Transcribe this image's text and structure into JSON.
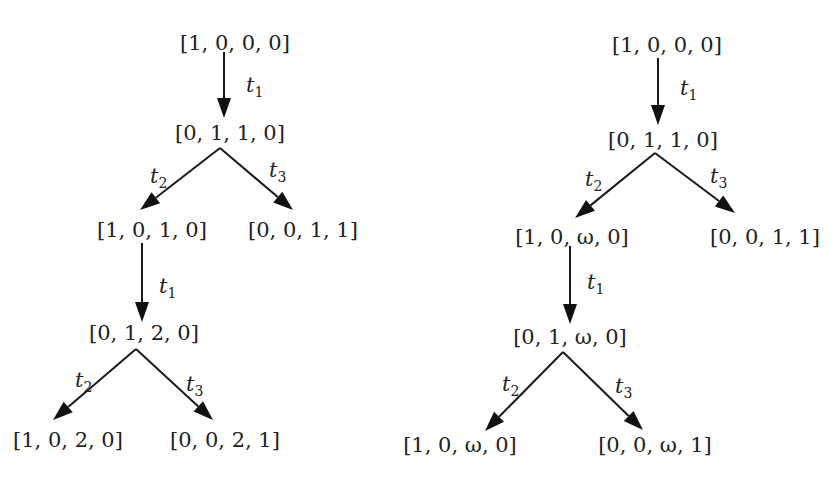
{
  "diagram": {
    "type": "coverability-trees",
    "colors": {
      "ink": "#1a1a1a",
      "background": "#ffffff"
    },
    "trees": [
      {
        "id": "reachability-tree",
        "nodes": [
          {
            "id": "a0",
            "label": "[1, 0, 0, 0]",
            "x": 235,
            "y": 43
          },
          {
            "id": "a1",
            "label": "[0, 1, 1, 0]",
            "x": 230,
            "y": 133
          },
          {
            "id": "a2",
            "label": "[1, 0, 1, 0]",
            "x": 152,
            "y": 230
          },
          {
            "id": "a3",
            "label": "[0, 0, 1, 1]",
            "x": 303,
            "y": 230
          },
          {
            "id": "a4",
            "label": "[0, 1, 2, 0]",
            "x": 144,
            "y": 333
          },
          {
            "id": "a5",
            "label": "[1, 0, 2, 0]",
            "x": 68,
            "y": 440
          },
          {
            "id": "a6",
            "label": "[0, 0, 2, 1]",
            "x": 225,
            "y": 440
          }
        ],
        "edges": [
          {
            "from": "a0",
            "to": "a1",
            "base": "t",
            "sub": "1",
            "x1": 224,
            "y1": 52,
            "x2": 224,
            "y2": 118,
            "lx": 246,
            "ly": 92
          },
          {
            "from": "a1",
            "to": "a2",
            "base": "t",
            "sub": "2",
            "x1": 220,
            "y1": 148,
            "x2": 140,
            "y2": 210,
            "lx": 150,
            "ly": 183
          },
          {
            "from": "a1",
            "to": "a3",
            "base": "t",
            "sub": "3",
            "x1": 220,
            "y1": 148,
            "x2": 293,
            "y2": 210,
            "lx": 269,
            "ly": 177
          },
          {
            "from": "a2",
            "to": "a4",
            "base": "t",
            "sub": "1",
            "x1": 142,
            "y1": 243,
            "x2": 142,
            "y2": 322,
            "lx": 159,
            "ly": 293
          },
          {
            "from": "a4",
            "to": "a5",
            "base": "t",
            "sub": "2",
            "x1": 136,
            "y1": 349,
            "x2": 53,
            "y2": 420,
            "lx": 75,
            "ly": 387
          },
          {
            "from": "a4",
            "to": "a6",
            "base": "t",
            "sub": "3",
            "x1": 136,
            "y1": 349,
            "x2": 213,
            "y2": 420,
            "lx": 186,
            "ly": 391
          }
        ]
      },
      {
        "id": "coverability-tree",
        "nodes": [
          {
            "id": "b0",
            "label": "[1, 0, 0, 0]",
            "x": 667,
            "y": 45
          },
          {
            "id": "b1",
            "label": "[0, 1, 1, 0]",
            "x": 663,
            "y": 140
          },
          {
            "id": "b2",
            "label": "[1, 0, ω, 0]",
            "x": 572,
            "y": 237
          },
          {
            "id": "b3",
            "label": "[0, 0, 1, 1]",
            "x": 765,
            "y": 237
          },
          {
            "id": "b4",
            "label": "[0, 1, ω, 0]",
            "x": 570,
            "y": 337
          },
          {
            "id": "b5",
            "label": "[1, 0, ω, 0]",
            "x": 460,
            "y": 445
          },
          {
            "id": "b6",
            "label": "[0, 0, ω, 1]",
            "x": 655,
            "y": 445
          }
        ],
        "edges": [
          {
            "from": "b0",
            "to": "b1",
            "base": "t",
            "sub": "1",
            "x1": 658,
            "y1": 58,
            "x2": 658,
            "y2": 125,
            "lx": 680,
            "ly": 95
          },
          {
            "from": "b1",
            "to": "b2",
            "base": "t",
            "sub": "2",
            "x1": 655,
            "y1": 153,
            "x2": 575,
            "y2": 218,
            "lx": 585,
            "ly": 186
          },
          {
            "from": "b1",
            "to": "b3",
            "base": "t",
            "sub": "3",
            "x1": 655,
            "y1": 153,
            "x2": 735,
            "y2": 213,
            "lx": 710,
            "ly": 183
          },
          {
            "from": "b2",
            "to": "b4",
            "base": "t",
            "sub": "1",
            "x1": 570,
            "y1": 246,
            "x2": 570,
            "y2": 324,
            "lx": 587,
            "ly": 289
          },
          {
            "from": "b4",
            "to": "b5",
            "base": "t",
            "sub": "2",
            "x1": 563,
            "y1": 352,
            "x2": 485,
            "y2": 431,
            "lx": 502,
            "ly": 391
          },
          {
            "from": "b4",
            "to": "b6",
            "base": "t",
            "sub": "3",
            "x1": 563,
            "y1": 352,
            "x2": 643,
            "y2": 430,
            "lx": 615,
            "ly": 393
          }
        ]
      }
    ]
  }
}
